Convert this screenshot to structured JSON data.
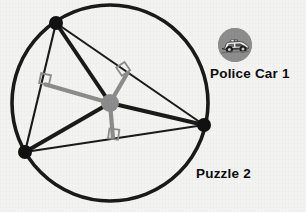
{
  "canvas": {
    "width": 306,
    "height": 212,
    "background": "#f3f3f1"
  },
  "labels": {
    "police_car": "Police Car 1",
    "puzzle": "Puzzle 2"
  },
  "icons": {
    "police_car_avatar": "police-car-icon",
    "avatar_background": "#8d8d8d"
  },
  "chart_data": {
    "type": "diagram",
    "colors": {
      "circle_stroke": "#1a1a1a",
      "triangle_stroke": "#1a1a1a",
      "cevian_stroke": "#1a1a1a",
      "bisector_stroke": "#8c8c8c",
      "vertex_fill": "#111111",
      "center_fill": "#8c8c8c",
      "right_angle_stroke": "#8c8c8c"
    },
    "circle": {
      "cx": 110,
      "cy": 103,
      "r": 98,
      "stroke_width": 3.6
    },
    "center_point": {
      "x": 110,
      "y": 103,
      "r": 9,
      "label": "circumcenter"
    },
    "vertices": [
      {
        "name": "A",
        "x": 56,
        "y": 23,
        "r": 7
      },
      {
        "name": "B",
        "x": 25,
        "y": 152,
        "r": 7
      },
      {
        "name": "C",
        "x": 204,
        "y": 125,
        "r": 7
      }
    ],
    "triangle_edges": [
      {
        "from": "A",
        "to": "B"
      },
      {
        "from": "B",
        "to": "C"
      },
      {
        "from": "C",
        "to": "A"
      }
    ],
    "radii_segments": [
      {
        "from": "center",
        "to": "A"
      },
      {
        "from": "center",
        "to": "B"
      },
      {
        "from": "center",
        "to": "C"
      }
    ],
    "perpendicular_bisectors": [
      {
        "side": "AB",
        "foot_x": 44,
        "foot_y": 84,
        "right_angle": 90
      },
      {
        "side": "AC",
        "foot_x": 128,
        "foot_y": 72,
        "right_angle": 90
      },
      {
        "side": "BC",
        "foot_x": 113,
        "foot_y": 138,
        "right_angle": 90
      }
    ],
    "right_angle_markers": [
      {
        "at_side": "AB",
        "x": 44,
        "y": 84,
        "size": 9
      },
      {
        "at_side": "AC",
        "x": 128,
        "y": 72,
        "size": 9
      },
      {
        "at_side": "BC",
        "x": 113,
        "y": 138,
        "size": 9
      }
    ]
  }
}
